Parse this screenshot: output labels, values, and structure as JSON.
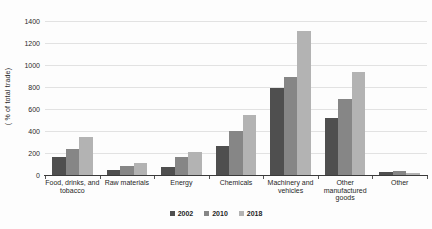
{
  "chart_data": {
    "type": "bar",
    "title": "",
    "xlabel": "",
    "ylabel": "( % of total trade)",
    "categories": [
      "Food, drinks, and tobacco",
      "Raw materials",
      "Energy",
      "Chemicals",
      "Machinery and vehicles",
      "Other manufactured goods",
      "Other"
    ],
    "series": [
      {
        "name": "2002",
        "color": "#4f4f4f",
        "values": [
          160,
          50,
          70,
          260,
          790,
          520,
          30
        ]
      },
      {
        "name": "2010",
        "color": "#868686",
        "values": [
          240,
          85,
          165,
          400,
          890,
          690,
          35
        ]
      },
      {
        "name": "2018",
        "color": "#b3b3b3",
        "values": [
          350,
          105,
          210,
          550,
          1310,
          940,
          15
        ]
      }
    ],
    "ylim": [
      0,
      1400
    ],
    "yticks": [
      0,
      200,
      400,
      600,
      800,
      1000,
      1200,
      1400
    ],
    "grid": true,
    "legend_position": "bottom",
    "gridline_color": "#e2e2e2",
    "axis_color": "#3a3a3a"
  }
}
